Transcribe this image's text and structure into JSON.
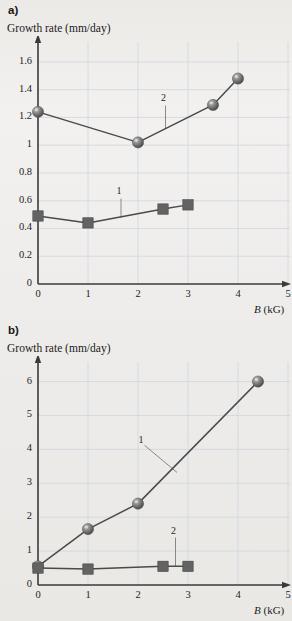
{
  "figure": {
    "background_color": "#efeeec",
    "marker_color": "#6f6f6f",
    "line_color": "#4a4a4a",
    "grid_color": "#cfd6e0",
    "axis_color": "#3a3a3a"
  },
  "panels": [
    {
      "letter": "a)",
      "y_axis_title": "Growth rate (mm/day)",
      "x_axis_label_symbol": "B",
      "x_axis_label_unit": "(kG)",
      "annotations": [
        {
          "label": "1",
          "x": 1.63,
          "y": 0.66
        },
        {
          "label": "2",
          "x": 2.52,
          "y": 1.33
        }
      ]
    },
    {
      "letter": "b)",
      "y_axis_title": "Growth rate (mm/day)",
      "x_axis_label_symbol": "B",
      "x_axis_label_unit": "(kG)",
      "annotations": [
        {
          "label": "1",
          "x": 2.07,
          "y": 4.25
        },
        {
          "label": "2",
          "x": 2.72,
          "y": 1.55
        }
      ]
    }
  ],
  "chart_data": [
    {
      "type": "line",
      "panel": "a)",
      "title": "",
      "xlabel": "B (kG)",
      "ylabel": "Growth rate (mm/day)",
      "xlim": [
        0,
        5
      ],
      "ylim": [
        0,
        1.7
      ],
      "xticks": [
        0,
        1,
        2,
        3,
        4,
        5
      ],
      "yticks": [
        0,
        0.2,
        0.4,
        0.6,
        0.8,
        1,
        1.2,
        1.4,
        1.6
      ],
      "xtick_labels": [
        "0",
        "1",
        "2",
        "3",
        "4",
        "5"
      ],
      "ytick_labels": [
        "0",
        "0.2",
        "0.4",
        "0.6",
        "0.8",
        "1",
        "1.2",
        "1.4",
        "1.6"
      ],
      "grid": true,
      "legend_position": "inline-annotation",
      "series": [
        {
          "name": "1",
          "marker": "square",
          "x": [
            0,
            1,
            2.5,
            3
          ],
          "values": [
            0.49,
            0.44,
            0.54,
            0.57
          ]
        },
        {
          "name": "2",
          "marker": "sphere",
          "x": [
            0,
            2,
            3.5,
            4
          ],
          "values": [
            1.24,
            1.02,
            1.29,
            1.48
          ]
        }
      ]
    },
    {
      "type": "line",
      "panel": "b)",
      "title": "",
      "xlabel": "B (kG)",
      "ylabel": "Growth rate (mm/day)",
      "xlim": [
        0,
        5
      ],
      "ylim": [
        0,
        6.4
      ],
      "xticks": [
        0,
        1,
        2,
        3,
        4,
        5
      ],
      "yticks": [
        0,
        1,
        2,
        3,
        4,
        5,
        6
      ],
      "xtick_labels": [
        "0",
        "1",
        "2",
        "3",
        "4",
        "5"
      ],
      "ytick_labels": [
        "0",
        "1",
        "2",
        "3",
        "4",
        "5",
        "6"
      ],
      "grid": true,
      "legend_position": "inline-annotation",
      "series": [
        {
          "name": "1",
          "marker": "sphere",
          "x": [
            0,
            1,
            2,
            4.4
          ],
          "values": [
            0.55,
            1.65,
            2.4,
            6.0
          ]
        },
        {
          "name": "2",
          "marker": "square",
          "x": [
            0,
            1,
            2.5,
            3
          ],
          "values": [
            0.5,
            0.47,
            0.55,
            0.55
          ]
        }
      ]
    }
  ]
}
